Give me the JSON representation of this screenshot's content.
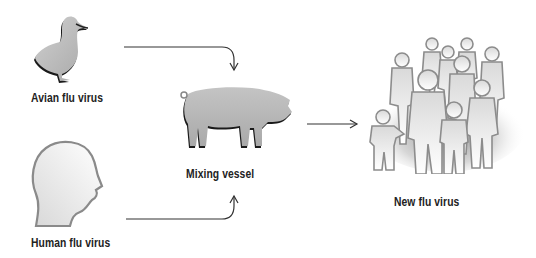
{
  "diagram": {
    "nodes": {
      "avian": {
        "label": "Avian flu virus",
        "icon": "duck-icon"
      },
      "human": {
        "label": "Human flu virus",
        "icon": "human-head-icon"
      },
      "mixing": {
        "label": "Mixing vessel",
        "icon": "pig-icon"
      },
      "new": {
        "label": "New flu virus",
        "icon": "crowd-icon"
      }
    },
    "edges": [
      {
        "from": "avian",
        "to": "mixing",
        "style": "curved-arrow-down"
      },
      {
        "from": "human",
        "to": "mixing",
        "style": "curved-arrow-up"
      },
      {
        "from": "mixing",
        "to": "new",
        "style": "straight-arrow-right"
      }
    ],
    "colors": {
      "arrow": "#333333",
      "silhouette_fill": "#b5b5b5",
      "outline": "#8a8a8a",
      "text": "#222222"
    }
  }
}
